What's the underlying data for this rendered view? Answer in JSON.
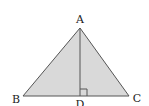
{
  "diagram": {
    "type": "geometry",
    "colors": {
      "fill": "#d9d9d9",
      "stroke": "#555555",
      "label": "#222222",
      "background": "#ffffff"
    },
    "points": {
      "A": {
        "label": "A",
        "x": 80,
        "y": 28
      },
      "B": {
        "label": "B",
        "x": 23,
        "y": 96
      },
      "C": {
        "label": "C",
        "x": 129,
        "y": 96
      },
      "D": {
        "label": "D",
        "x": 80,
        "y": 96
      }
    },
    "segments": [
      "AB",
      "AC",
      "BC",
      "AD"
    ],
    "right_angle": {
      "at": "D",
      "between": [
        "AD",
        "DC"
      ],
      "size": 7
    },
    "labels": {
      "A": "A",
      "B": "B",
      "C": "C",
      "D": "D"
    }
  }
}
